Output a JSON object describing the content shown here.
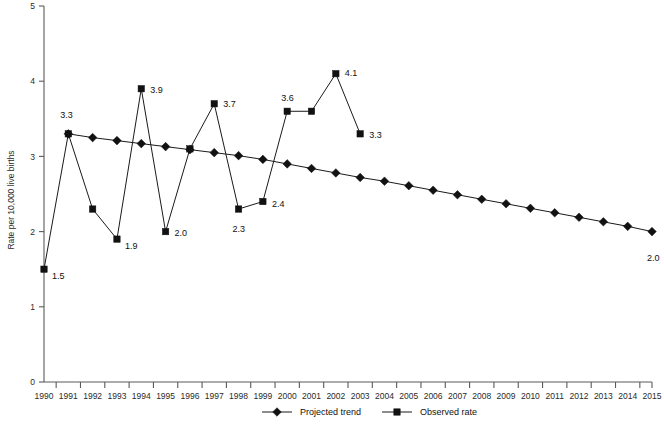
{
  "chart_data": {
    "type": "line",
    "title": "",
    "xlabel": "",
    "ylabel": "Rate per 10,000 live births",
    "xlim": [
      1990,
      2015
    ],
    "ylim": [
      0,
      5
    ],
    "yticks": [
      "0",
      "1",
      "2",
      "3",
      "4",
      "5"
    ],
    "grid": false,
    "legend_position": "bottom",
    "x": [
      1990,
      1991,
      1992,
      1993,
      1994,
      1995,
      1996,
      1997,
      1998,
      1999,
      2000,
      2001,
      2002,
      2003,
      2004,
      2005,
      2006,
      2007,
      2008,
      2009,
      2010,
      2011,
      2012,
      2013,
      2014,
      2015
    ],
    "categories": [
      "1990",
      "1991",
      "1992",
      "1993",
      "1994",
      "1995",
      "1996",
      "1997",
      "1998",
      "1999",
      "2000",
      "2001",
      "2002",
      "2003",
      "2004",
      "2005",
      "2006",
      "2007",
      "2008",
      "2009",
      "2010",
      "2011",
      "2012",
      "2013",
      "2014",
      "2015"
    ],
    "series": [
      {
        "name": "Observed rate",
        "marker": "square",
        "x": [
          1990,
          1991,
          1992,
          1993,
          1994,
          1995,
          1996,
          1997,
          1998,
          1999,
          2000,
          2001,
          2002,
          2003
        ],
        "values": [
          1.5,
          3.3,
          2.3,
          1.9,
          3.9,
          2.0,
          3.1,
          3.7,
          2.3,
          2.4,
          3.6,
          3.6,
          4.1,
          3.3
        ],
        "labels": [
          "1.5",
          "3.3",
          "",
          "1.9",
          "3.9",
          "2.0",
          "",
          "3.7",
          "2.3",
          "2.4",
          "3.6",
          "",
          "4.1",
          "3.3"
        ]
      },
      {
        "name": "Projected trend",
        "marker": "diamond",
        "x": [
          1991,
          1992,
          1993,
          1994,
          1995,
          1996,
          1997,
          1998,
          1999,
          2000,
          2001,
          2002,
          2003,
          2004,
          2005,
          2006,
          2007,
          2008,
          2009,
          2010,
          2011,
          2012,
          2013,
          2014,
          2015
        ],
        "values": [
          3.3,
          3.25,
          3.21,
          3.17,
          3.13,
          3.09,
          3.05,
          3.01,
          2.96,
          2.9,
          2.84,
          2.78,
          2.72,
          2.67,
          2.61,
          2.55,
          2.49,
          2.43,
          2.37,
          2.31,
          2.25,
          2.19,
          2.13,
          2.07,
          2.0
        ],
        "labels": [
          "",
          "",
          "",
          "",
          "",
          "",
          "",
          "",
          "",
          "",
          "",
          "",
          "",
          "",
          "",
          "",
          "",
          "",
          "",
          "",
          "",
          "",
          "",
          "",
          "2.0"
        ]
      }
    ],
    "legend": [
      {
        "label": "Projected trend",
        "marker": "diamond"
      },
      {
        "label": "Observed rate",
        "marker": "square"
      }
    ],
    "colors": {
      "series": "#111111",
      "axis": "#5a5a5a",
      "text": "#1a1a1a",
      "background": "#ffffff"
    }
  }
}
